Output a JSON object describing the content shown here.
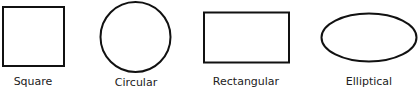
{
  "diagram": {
    "title": "",
    "stroke_color": "#111111",
    "label_color": "#222222",
    "items": [
      {
        "label": "Square",
        "shape": "square"
      },
      {
        "label": "Circular",
        "shape": "circle"
      },
      {
        "label": "Rectangular",
        "shape": "rectangle"
      },
      {
        "label": "Elliptical",
        "shape": "ellipse"
      }
    ]
  }
}
